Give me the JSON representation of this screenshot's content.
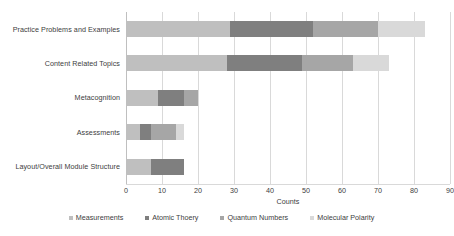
{
  "chart_data": {
    "type": "bar",
    "orientation": "horizontal",
    "stacked": true,
    "title": "",
    "xlabel": "Counts",
    "ylabel": "",
    "xlim": [
      0,
      90
    ],
    "xticks": [
      0,
      10,
      20,
      30,
      40,
      50,
      60,
      70,
      80,
      90
    ],
    "grid": "vertical",
    "legend_position": "bottom",
    "categories": [
      "Practice Problems and Examples",
      "Content Related Topics",
      "Metacognition",
      "Assessments",
      "Layout/Overall Module Structure"
    ],
    "series": [
      {
        "name": "Measurements",
        "color": "#bfbfbf",
        "values": [
          29,
          28,
          9,
          4,
          7
        ]
      },
      {
        "name": "Atomic Thoery",
        "color": "#7f7f7f",
        "values": [
          23,
          21,
          7,
          3,
          9
        ]
      },
      {
        "name": "Quantum Numbers",
        "color": "#a6a6a6",
        "values": [
          18,
          14,
          4,
          7,
          0
        ]
      },
      {
        "name": "Molecular Polarity",
        "color": "#d9d9d9",
        "values": [
          13,
          10,
          0,
          2,
          0
        ]
      }
    ],
    "totals": [
      83,
      73,
      20,
      16,
      16
    ]
  },
  "legend": {
    "items": [
      {
        "label": "Measurements"
      },
      {
        "label": "Atomic Thoery"
      },
      {
        "label": "Quantum Numbers"
      },
      {
        "label": "Molecular Polarity"
      }
    ]
  },
  "axis": {
    "x_title": "Counts"
  },
  "colors": {
    "background": "#ffffff",
    "text": "#404040",
    "gridline": "#d9d9d9"
  }
}
